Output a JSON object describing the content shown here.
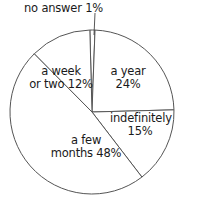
{
  "chart_data": {
    "type": "pie",
    "title": "",
    "slices": [
      {
        "label": "no answer",
        "value": 1,
        "text": "no answer 1%"
      },
      {
        "label": "a year",
        "value": 24,
        "text_line1": "a year",
        "text_line2": "24%"
      },
      {
        "label": "indefinitely",
        "value": 15,
        "text_line1": "indefinitely",
        "text_line2": "15%"
      },
      {
        "label": "a few months",
        "value": 48,
        "text_line1": "a few",
        "text_line2": "months 48%"
      },
      {
        "label": "a week or two",
        "value": 12,
        "text_line1": "a week",
        "text_line2": "or two 12%"
      }
    ],
    "legend": "none",
    "fill_color": "#ffffff",
    "stroke_color": "#555555"
  },
  "labels": {
    "no_answer": "no answer 1%",
    "year_1": "a year",
    "year_2": "24%",
    "indef_1": "indefinitely",
    "indef_2": "15%",
    "months_1": "a few",
    "months_2": "months 48%",
    "week_1": "a week",
    "week_2": "or two 12%"
  }
}
